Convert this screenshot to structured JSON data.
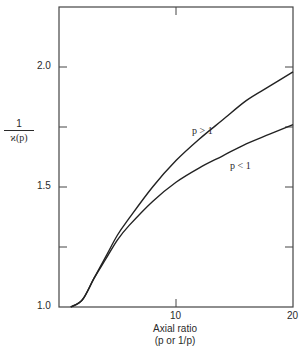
{
  "chart_data": {
    "type": "line",
    "title": "",
    "xlabel": "Axial ratio",
    "xlabel_sub": "(p or 1/p)",
    "ylabel_num": "1",
    "ylabel_den": "ϰ(p)",
    "xlim": [
      0,
      20
    ],
    "ylim": [
      1.0,
      2.25
    ],
    "x_ticks": [
      10,
      20
    ],
    "x_tick_labels": [
      "10",
      "20"
    ],
    "y_ticks": [
      1.0,
      1.25,
      1.5,
      1.75,
      2.0
    ],
    "y_tick_labels": [
      "1.0",
      "",
      "1.5",
      "",
      "2.0"
    ],
    "grid": false,
    "series": [
      {
        "name": "p > 1",
        "x": [
          1,
          2,
          3,
          4,
          5,
          6,
          8,
          10,
          12,
          14,
          16,
          18,
          20
        ],
        "values": [
          1.0,
          1.03,
          1.12,
          1.21,
          1.3,
          1.37,
          1.5,
          1.61,
          1.7,
          1.78,
          1.86,
          1.92,
          1.98
        ]
      },
      {
        "name": "p < 1",
        "x": [
          1,
          2,
          3,
          4,
          5,
          6,
          8,
          10,
          12,
          14,
          16,
          18,
          20
        ],
        "values": [
          1.0,
          1.03,
          1.12,
          1.2,
          1.28,
          1.34,
          1.44,
          1.52,
          1.58,
          1.63,
          1.68,
          1.72,
          1.76
        ]
      }
    ],
    "annotations": [
      {
        "text": "p > 1",
        "x": 12.5,
        "y": 1.68
      },
      {
        "text": "p < 1",
        "x": 14.5,
        "y": 1.54
      }
    ]
  }
}
